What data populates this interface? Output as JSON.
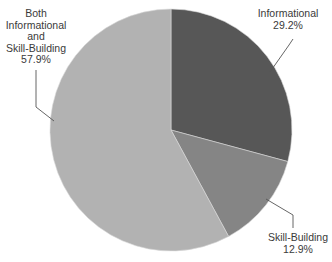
{
  "chart_data": {
    "type": "pie",
    "title": "",
    "categories": [
      "Informational",
      "Skill-Building",
      "Both Informational and Skill-Building"
    ],
    "values": [
      29.2,
      12.9,
      57.9
    ],
    "unit": "%",
    "start_angle": "12 o'clock",
    "direction": "clockwise",
    "colors": [
      "#575757",
      "#858585",
      "#b2b2b2"
    ],
    "legend": "none (callout labels with leader lines)"
  },
  "labels": {
    "informational": {
      "name": "Informational",
      "pct": "29.2%"
    },
    "skill": {
      "name": "Skill-Building",
      "pct": "12.9%"
    },
    "both": {
      "line1": "Both",
      "line2": "Informational",
      "line3": "and",
      "line4": "Skill-Building",
      "pct": "57.9%"
    }
  }
}
